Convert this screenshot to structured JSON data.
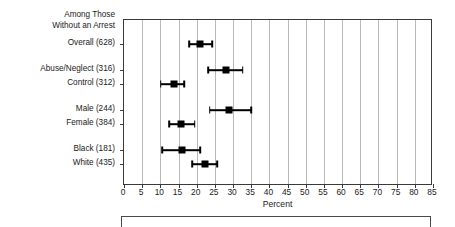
{
  "chart_data": {
    "type": "scatter",
    "title": "",
    "xlabel": "Percent",
    "ylabel": "",
    "xlim": [
      0,
      85
    ],
    "xtick_step": 5,
    "grid": true,
    "legend": "none",
    "orientation": "horizontal",
    "header_lines": [
      "Among Those",
      "Without an Arrest"
    ],
    "xticks": [
      "0",
      "5",
      "10",
      "15",
      "20",
      "25",
      "30",
      "35",
      "40",
      "45",
      "50",
      "55",
      "60",
      "65",
      "70",
      "75",
      "80",
      "85"
    ],
    "categories": [
      "Overall (628)",
      "Abuse/Neglect (316)",
      "Control (312)",
      "Male (244)",
      "Female (384)",
      "Black (181)",
      "White (435)"
    ],
    "points": [
      {
        "label": "Overall (628)",
        "value": 21.0,
        "ci_low": 18.0,
        "ci_high": 24.2,
        "group": 0
      },
      {
        "label": "Abuse/Neglect (316)",
        "value": 28.0,
        "ci_low": 23.1,
        "ci_high": 32.6,
        "group": 1
      },
      {
        "label": "Control (312)",
        "value": 13.8,
        "ci_low": 10.1,
        "ci_high": 16.6,
        "group": 1
      },
      {
        "label": "Male (244)",
        "value": 29.0,
        "ci_low": 23.6,
        "ci_high": 35.0,
        "group": 2
      },
      {
        "label": "Female (384)",
        "value": 15.8,
        "ci_low": 12.5,
        "ci_high": 19.5,
        "group": 2
      },
      {
        "label": "Black (181)",
        "value": 16.0,
        "ci_low": 10.5,
        "ci_high": 21.0,
        "group": 3
      },
      {
        "label": "White (435)",
        "value": 22.2,
        "ci_low": 18.8,
        "ci_high": 25.6,
        "group": 3
      }
    ],
    "series": [
      {
        "name": "Percent with outcome",
        "values": [
          21.0,
          28.0,
          13.8,
          29.0,
          15.8,
          16.0,
          22.2
        ],
        "ci_low": [
          18.0,
          23.1,
          10.1,
          23.6,
          12.5,
          10.5,
          18.8
        ],
        "ci_high": [
          24.2,
          32.6,
          16.6,
          35.0,
          19.5,
          21.0,
          25.6
        ]
      }
    ]
  },
  "colors": {
    "marker": "#000000",
    "grid": "#b9b9b9",
    "frame": "#3a3a3a",
    "text": "#1a1a1a",
    "background": "#ffffff"
  }
}
